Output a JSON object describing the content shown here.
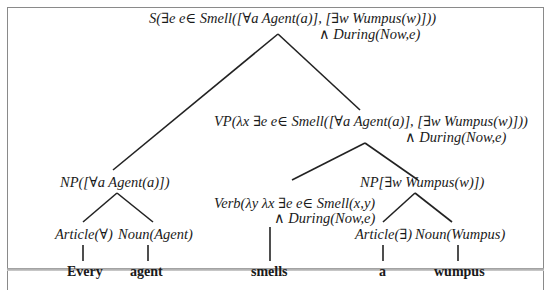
{
  "diagram": {
    "type": "parse-tree",
    "nodes": {
      "s": {
        "line1": "S(∃e e∈ Smell([∀a Agent(a)], [∃w Wumpus(w)]))",
        "line2": "∧ During(Now,e)"
      },
      "vp": {
        "line1": "VP(λx ∃e e∈ Smell([∀a Agent(a)], [∃w Wumpus(w)]))",
        "line2": "∧ During(Now,e)"
      },
      "np_left": {
        "line1": "NP([∀a Agent(a)])"
      },
      "np_right": {
        "line1": "NP[∃w Wumpus(w)])"
      },
      "verb": {
        "line1": "Verb(λy λx ∃e e∈ Smell(x,y)",
        "line2": "∧ During(Now,e)"
      },
      "article_every": {
        "line1": "Article(∀)"
      },
      "noun_agent": {
        "line1": "Noun(Agent)"
      },
      "article_a": {
        "line1": "Article(∃)"
      },
      "noun_wumpus": {
        "line1": "Noun(Wumpus)"
      }
    },
    "words": [
      "Every",
      "agent",
      "smells",
      "a",
      "wumpus"
    ],
    "edges": [
      {
        "from": "S",
        "to": "NP([∀a Agent(a)])"
      },
      {
        "from": "S",
        "to": "VP"
      },
      {
        "from": "VP",
        "to": "Verb"
      },
      {
        "from": "VP",
        "to": "NP[∃w Wumpus(w)]"
      },
      {
        "from": "NP([∀a Agent(a)])",
        "to": "Article(∀)"
      },
      {
        "from": "NP([∀a Agent(a)])",
        "to": "Noun(Agent)"
      },
      {
        "from": "NP[∃w Wumpus(w)]",
        "to": "Article(∃)"
      },
      {
        "from": "NP[∃w Wumpus(w)]",
        "to": "Noun(Wumpus)"
      },
      {
        "from": "Article(∀)",
        "to": "Every"
      },
      {
        "from": "Noun(Agent)",
        "to": "agent"
      },
      {
        "from": "Verb",
        "to": "smells"
      },
      {
        "from": "Article(∃)",
        "to": "a"
      },
      {
        "from": "Noun(Wumpus)",
        "to": "wumpus"
      }
    ],
    "colors": {
      "line": "#222222",
      "frame": "#8a8a8a",
      "background": "#ffffff"
    }
  }
}
